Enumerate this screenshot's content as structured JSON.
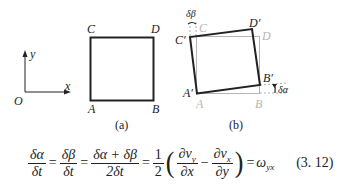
{
  "figure": {
    "axes": {
      "origin": "O",
      "x_label": "x",
      "y_label": "y"
    },
    "panel_a": {
      "caption": "(a)",
      "vertices": {
        "A": "A",
        "B": "B",
        "C": "C",
        "D": "D"
      }
    },
    "panel_b": {
      "caption": "(b)",
      "original_vertices": {
        "A": "A",
        "B": "B",
        "C": "C",
        "D": "D"
      },
      "rotated_vertices": {
        "A": "A′",
        "B": "B′",
        "C": "C′",
        "D": "D′"
      },
      "angle_beta": "δβ",
      "angle_alpha": "δα"
    },
    "colors": {
      "ink": "#222222",
      "original_outline": "#b5b5b5"
    }
  },
  "equation": {
    "frac1_num": "δα",
    "frac1_den": "δt",
    "eq1": "=",
    "frac2_num": "δβ",
    "frac2_den": "δt",
    "eq2": "=",
    "frac3_num": "δα + δβ",
    "frac3_den": "2δt",
    "eq3": "=",
    "frac4_num": "1",
    "frac4_den": "2",
    "lparen": "(",
    "frac5_num": "∂v",
    "frac5_num_sub": "y",
    "frac5_den": "∂x",
    "minus": "−",
    "frac6_num": "∂v",
    "frac6_num_sub": "x",
    "frac6_den": "∂y",
    "rparen": ")",
    "eq4": "=",
    "result": "ω",
    "result_sub": "yx",
    "number": "(3. 12)"
  }
}
